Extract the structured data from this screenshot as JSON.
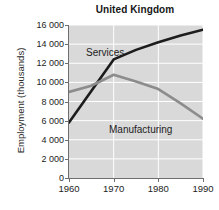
{
  "chart_data": {
    "type": "line",
    "title": "United Kingdom",
    "xlabel": "",
    "ylabel": "Employment (thousands)",
    "xlim": [
      1960,
      1990
    ],
    "ylim": [
      0,
      16000
    ],
    "grid": true,
    "legend_position": "inline-annotations",
    "xticks": [
      "1960",
      "1970",
      "1980",
      "1990"
    ],
    "xtick_values": [
      1960,
      1970,
      1980,
      1990
    ],
    "yticks": [
      "0",
      "2 000",
      "4 000",
      "6 000",
      "8 000",
      "10 000",
      "12 000",
      "14 000",
      "16 000"
    ],
    "ytick_values": [
      0,
      2000,
      4000,
      6000,
      8000,
      10000,
      12000,
      14000,
      16000
    ],
    "x": [
      1960,
      1965,
      1970,
      1975,
      1980,
      1985,
      1990
    ],
    "series": [
      {
        "name": "Services",
        "color": "#1c1c1c",
        "values": [
          5800,
          9100,
          12400,
          13400,
          14200,
          14900,
          15500
        ]
      },
      {
        "name": "Manufacturing",
        "color": "#8c8c8c",
        "values": [
          9000,
          9650,
          10800,
          10100,
          9300,
          7800,
          6200
        ]
      }
    ],
    "annotations": [
      {
        "text": "Services",
        "series": "Services"
      },
      {
        "text": "Manufacturing",
        "series": "Manufacturing"
      }
    ]
  },
  "style": {
    "plot_background": "#d9d9d9",
    "gridline_color": "#ffffff",
    "axis_color": "#6e6e6e",
    "page_background": "#ffffff"
  }
}
